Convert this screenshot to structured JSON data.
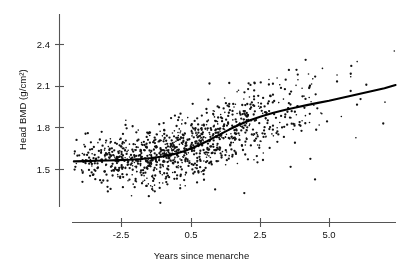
{
  "chart_data": {
    "type": "scatter",
    "title": "",
    "xlabel": "Years since menarche",
    "ylabel": "Head BMD (g/cm2)",
    "ylabel_display": "Head BMD (g/cm²)",
    "xticks": [
      "-2.5",
      "0.5",
      "2.5",
      "5.0"
    ],
    "xtick_values": [
      -2.5,
      0.5,
      2.5,
      5.0
    ],
    "yticks": [
      "1.5",
      "1.8",
      "2.1",
      "2.4"
    ],
    "ytick_values": [
      1.5,
      1.8,
      2.1,
      2.4
    ],
    "xlim": [
      -4.2,
      7.4
    ],
    "ylim": [
      1.25,
      2.58
    ],
    "grid": false,
    "legend": null,
    "point_color": "#111111",
    "line_color": "#000000",
    "axis_color": "#555555",
    "n_points": 1100,
    "series": [
      {
        "name": "Head BMD observations",
        "type": "scatter",
        "marker": "dot",
        "size": 1.4,
        "note": "Individual subject head bone mineral density versus years since menarche; dense cloud widening and rising to the right."
      },
      {
        "name": "Smoothed trend",
        "type": "line",
        "x": [
          -4.2,
          -3.8,
          -3.4,
          -3.0,
          -2.6,
          -2.2,
          -1.8,
          -1.4,
          -1.0,
          -0.6,
          -0.2,
          0.2,
          0.6,
          1.0,
          1.4,
          1.8,
          2.2,
          2.6,
          3.0,
          3.4,
          3.8,
          4.2,
          4.6,
          5.0,
          5.4,
          5.8,
          6.2,
          6.6,
          7.0,
          7.4
        ],
        "y": [
          1.555,
          1.557,
          1.559,
          1.561,
          1.564,
          1.567,
          1.572,
          1.579,
          1.59,
          1.607,
          1.63,
          1.662,
          1.7,
          1.742,
          1.784,
          1.822,
          1.855,
          1.882,
          1.905,
          1.925,
          1.943,
          1.96,
          1.976,
          1.992,
          2.01,
          2.028,
          2.046,
          2.064,
          2.082,
          2.105
        ]
      }
    ],
    "scatter_density_model": {
      "description": "mean follows smoothed trend; residual spread grows from about 0.07 at left to 0.19 at right",
      "x_distribution": "denser between -1 and 5",
      "sd_left": 0.07,
      "sd_right": 0.19
    }
  }
}
